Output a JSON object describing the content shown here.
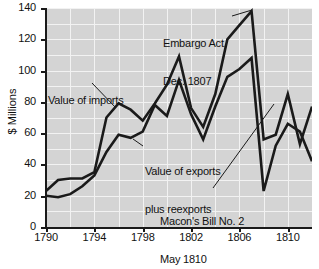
{
  "chart_data": {
    "type": "line",
    "title": "",
    "xlabel": "",
    "ylabel": "$ Millions",
    "xlim": [
      1790,
      1812
    ],
    "ylim": [
      0,
      140
    ],
    "grid": true,
    "legend": "none (direct labels)",
    "x": [
      1790,
      1791,
      1792,
      1793,
      1794,
      1795,
      1796,
      1797,
      1798,
      1799,
      1800,
      1801,
      1802,
      1803,
      1804,
      1805,
      1806,
      1807,
      1808,
      1809,
      1810,
      1811,
      1812
    ],
    "series": [
      {
        "name": "Value of imports",
        "values": [
          23,
          30,
          31,
          31,
          35,
          70,
          79,
          75,
          68,
          79,
          91,
          109,
          76,
          64,
          85,
          120,
          129,
          138,
          56,
          59,
          85,
          53,
          77
        ]
      },
      {
        "name": "Value of exports plus reexports",
        "values": [
          20,
          19,
          21,
          26,
          33,
          48,
          59,
          57,
          61,
          78,
          71,
          94,
          72,
          56,
          77,
          96,
          101,
          108,
          23,
          52,
          66,
          61,
          42
        ]
      }
    ],
    "x_tick_labels": [
      "1790",
      "1794",
      "1798",
      "1802",
      "1806",
      "1810"
    ],
    "x_tick_values": [
      1790,
      1794,
      1798,
      1802,
      1806,
      1810
    ],
    "y_tick_labels": [
      "0",
      "20",
      "40",
      "60",
      "80",
      "100",
      "120",
      "140"
    ],
    "y_tick_values": [
      0,
      20,
      40,
      60,
      80,
      100,
      120,
      140
    ],
    "annotations": [
      {
        "id": "embargo",
        "text": "Embargo Act,\nDec. 1807",
        "line1": "Embargo Act,",
        "line2": "Dec. 1807",
        "points_to_year": 1807,
        "points_to_value": 138
      },
      {
        "id": "imports",
        "text": "Value of imports",
        "line1": "Value of imports",
        "line2": "",
        "points_to_year": 1796,
        "points_to_value": 79
      },
      {
        "id": "exports",
        "text": "Value of exports\nplus reexports",
        "line1": "Value of exports",
        "line2": "plus reexports",
        "points_to_year": 1799,
        "points_to_value": 78
      },
      {
        "id": "macon",
        "text": "Macon's Bill No. 2\nMay 1810",
        "line1": "Macon's Bill No. 2",
        "line2": "May 1810",
        "points_to_year": 1810,
        "points_to_value": 85
      }
    ],
    "colors": {
      "plot_background": "#d4d4d4",
      "gridline": "#f2f2f2",
      "line": "#1a1a1a",
      "axis": "#1a1a1a",
      "page_background": "#ffffff",
      "text": "#111111"
    }
  }
}
